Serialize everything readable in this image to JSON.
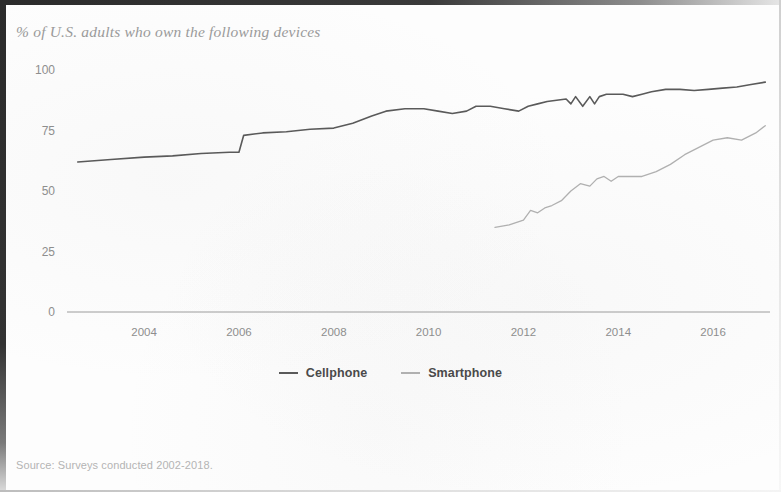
{
  "figure": {
    "title": "% of U.S. adults who own the following devices",
    "source_note": "Source: Surveys conducted 2002-2018."
  },
  "legend": {
    "position": "bottom-center",
    "items": [
      {
        "label": "Cellphone",
        "color": "#5a5a5a",
        "swatch_name": "legend-swatch-cellphone"
      },
      {
        "label": "Smartphone",
        "color": "#b0b0b0",
        "swatch_name": "legend-swatch-smartphone"
      }
    ]
  },
  "axes": {
    "y_ticks": [
      "0",
      "25",
      "50",
      "75",
      "100"
    ],
    "x_ticks": [
      "2004",
      "2006",
      "2008",
      "2010",
      "2012",
      "2014",
      "2016"
    ]
  },
  "chart_data": {
    "type": "line",
    "title": "% of U.S. adults who own the following devices",
    "subtitle": "",
    "xlabel": "",
    "ylabel": "",
    "xlim": [
      2002.5,
      2017.2
    ],
    "ylim": [
      0,
      100
    ],
    "grid": false,
    "legend_position": "bottom-center",
    "annotations": [
      "Source: Surveys conducted 2002-2018."
    ],
    "y_ticks": [
      0,
      25,
      50,
      75,
      100
    ],
    "x_ticks": [
      2004,
      2006,
      2008,
      2010,
      2012,
      2014,
      2016
    ],
    "series": [
      {
        "name": "Cellphone",
        "color": "#5a5a5a",
        "x": [
          2002.6,
          2003.3,
          2004.0,
          2004.6,
          2005.2,
          2005.8,
          2006.0,
          2006.1,
          2006.5,
          2007.0,
          2007.5,
          2008.0,
          2008.4,
          2008.8,
          2009.1,
          2009.5,
          2009.9,
          2010.2,
          2010.5,
          2010.8,
          2011.0,
          2011.3,
          2011.6,
          2011.9,
          2012.1,
          2012.3,
          2012.5,
          2012.7,
          2012.9,
          2013.0,
          2013.1,
          2013.25,
          2013.4,
          2013.5,
          2013.6,
          2013.75,
          2013.9,
          2014.1,
          2014.3,
          2014.5,
          2014.7,
          2015.0,
          2015.3,
          2015.6,
          2015.9,
          2016.2,
          2016.5,
          2016.8,
          2017.1
        ],
        "y": [
          62,
          63,
          64,
          64.5,
          65.5,
          66,
          66,
          73,
          74,
          74.5,
          75.5,
          76,
          78,
          81,
          83,
          84,
          84,
          83,
          82,
          83,
          85,
          85,
          84,
          83,
          85,
          86,
          87,
          87.5,
          88,
          86,
          89,
          85,
          89,
          86,
          89,
          90,
          90,
          90,
          89,
          90,
          91,
          92,
          92,
          91.5,
          92,
          92.5,
          93,
          94,
          95
        ]
      },
      {
        "name": "Smartphone",
        "color": "#b0b0b0",
        "x": [
          2011.4,
          2011.7,
          2012.0,
          2012.15,
          2012.3,
          2012.45,
          2012.6,
          2012.8,
          2013.0,
          2013.2,
          2013.4,
          2013.55,
          2013.7,
          2013.85,
          2014.0,
          2014.2,
          2014.5,
          2014.8,
          2015.1,
          2015.4,
          2015.7,
          2016.0,
          2016.3,
          2016.6,
          2016.9,
          2017.1
        ],
        "y": [
          35,
          36,
          38,
          42,
          41,
          43,
          44,
          46,
          50,
          53,
          52,
          55,
          56,
          54,
          56,
          56,
          56,
          58,
          61,
          65,
          68,
          71,
          72,
          71,
          74,
          77
        ]
      }
    ]
  }
}
